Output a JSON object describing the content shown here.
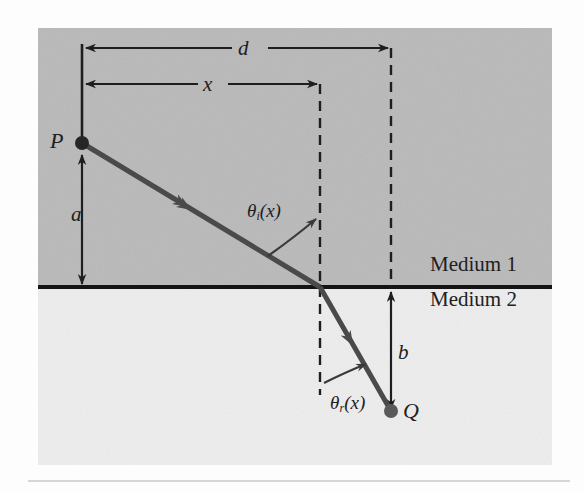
{
  "figure": {
    "type": "optics-refraction-diagram"
  },
  "colors": {
    "page_background": "#fdfdfd",
    "medium1_fill": "#b9b9b9",
    "medium2_fill": "#ededed",
    "interface_line": "#141414",
    "ray": "#4a4a4a",
    "dimension_line": "#1e1e1e",
    "dashed_line": "#1e1e1e",
    "text": "#20201e"
  },
  "labels": {
    "point_p": "P",
    "point_q": "Q",
    "distance_a": "a",
    "distance_b": "b",
    "distance_d": "d",
    "distance_x": "x",
    "theta_incident_base": "θ",
    "theta_incident_sub": "i",
    "theta_incident_arg": "(x)",
    "theta_refracted_base": "θ",
    "theta_refracted_sub": "r",
    "theta_refracted_arg": "(x)",
    "medium_1": "Medium 1",
    "medium_2": "Medium 2"
  },
  "geometry": {
    "point_p": {
      "x": 82,
      "y": 143
    },
    "point_q": {
      "x": 391,
      "y": 411
    },
    "refraction_point": {
      "x": 320,
      "y": 287
    },
    "interface_y": 287,
    "dashed_line_x_1": 320,
    "dashed_line_x_2": 391,
    "dimension_origin_x": 82,
    "dimension_d_y": 48,
    "dimension_x_y": 84
  }
}
